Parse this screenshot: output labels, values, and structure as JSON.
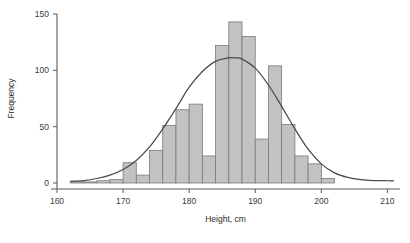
{
  "chart_data": {
    "type": "bar",
    "title": "",
    "subtitle": "",
    "xlabel": "Height, cm",
    "ylabel": "Frequency",
    "xlim": [
      160,
      211
    ],
    "ylim": [
      0,
      150
    ],
    "grid": false,
    "legend": null,
    "bin_width": 2,
    "x_ticks": [
      160,
      170,
      180,
      190,
      200,
      210
    ],
    "x_tick_labels": [
      "160",
      "170",
      "180",
      "190",
      "200",
      "210"
    ],
    "y_ticks": [
      0,
      50,
      100,
      150
    ],
    "y_tick_labels": [
      "0",
      "50",
      "100",
      "150"
    ],
    "bin_edges": [
      162,
      164,
      166,
      168,
      170,
      172,
      174,
      176,
      178,
      180,
      182,
      184,
      186,
      188,
      190,
      192,
      194,
      196,
      198,
      200,
      202
    ],
    "bin_centers": [
      163,
      165,
      167,
      169,
      171,
      173,
      175,
      177,
      179,
      181,
      183,
      185,
      187,
      189,
      191,
      193,
      195,
      197,
      199,
      201
    ],
    "categories": [
      "162-164",
      "164-166",
      "166-168",
      "168-170",
      "170-172",
      "172-174",
      "174-176",
      "176-178",
      "178-180",
      "180-182",
      "182-184",
      "184-186",
      "186-188",
      "188-190",
      "190-192",
      "192-194",
      "194-196",
      "196-198",
      "198-200",
      "200-202"
    ],
    "values": [
      1,
      1,
      2,
      3,
      18,
      7,
      29,
      51,
      65,
      70,
      24,
      122,
      143,
      130,
      39,
      104,
      52,
      24,
      17,
      4
    ],
    "overlay_curve": {
      "name": "normal-fit",
      "type": "line",
      "mean": 187,
      "peak_value": 111,
      "color": "#4a4a4a",
      "x": [
        162,
        164,
        166,
        168,
        170,
        172,
        174,
        176,
        178,
        180,
        182,
        184,
        186,
        187,
        188,
        190,
        192,
        194,
        196,
        198,
        200,
        202,
        204,
        206,
        208,
        210,
        211
      ],
      "y": [
        1.5,
        2.2,
        4,
        7,
        12,
        20,
        32,
        48,
        66,
        85,
        99,
        108,
        111,
        111,
        110,
        102,
        87,
        68,
        48,
        30,
        17,
        9,
        5,
        3,
        2.2,
        2,
        2
      ]
    },
    "styles": {
      "bar_fill": "#c2c2c2",
      "bar_stroke": "#7a7a7a",
      "axis_color": "#5a5a5a",
      "curve_color": "#4a4a4a",
      "text_color": "#2b2b2b",
      "background": "#ffffff"
    }
  }
}
